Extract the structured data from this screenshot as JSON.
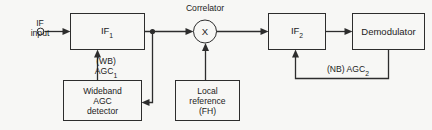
{
  "diagram": {
    "background_color": "#f7f7f5",
    "line_color": "#2d2d2d",
    "text_color": "#1c1c1c"
  },
  "input": {
    "label_line1": "IF",
    "label_line2": "input",
    "terminal_icon": "open-circle-terminal-icon"
  },
  "blocks": {
    "if1": {
      "label": "IF",
      "subscript": "1"
    },
    "if2": {
      "label": "IF",
      "subscript": "2"
    },
    "wideband_agc_detector": {
      "line1": "Wideband",
      "line2": "AGC",
      "line3": "detector"
    },
    "local_reference": {
      "line1": "Local",
      "line2": "reference",
      "line3": "(FH)"
    },
    "demodulator": {
      "label": "Demodulator"
    }
  },
  "correlator": {
    "title": "Correlator",
    "symbol": "X"
  },
  "signals": {
    "wb_agc": {
      "line1": "(WB)",
      "line2": "AGC",
      "subscript": "1"
    },
    "nb_agc": {
      "text": "(NB)  AGC",
      "subscript": "2"
    }
  }
}
